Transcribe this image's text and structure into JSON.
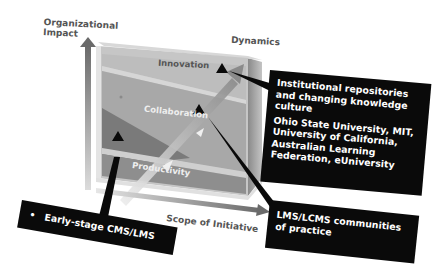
{
  "axes": {
    "y_label_line1": "Organizational",
    "y_label_line2": "Impact",
    "x_label": "Scope of Initiative",
    "dynamics_label": "Dynamics"
  },
  "layers": [
    {
      "name": "Innovation",
      "color": "#b9b9b9"
    },
    {
      "name": "Collaboration",
      "color": "#a2a2a2"
    },
    {
      "name": "Productivity",
      "color": "#888888"
    }
  ],
  "callouts": {
    "innovation": {
      "line1": "Institutional repositories",
      "line2": "and changing knowledge",
      "line3": "culture",
      "line4": "Ohio State University, MIT,",
      "line5": "University of California,",
      "line6": "Australian Learning",
      "line7": "Federation, eUniversity"
    },
    "collaboration": {
      "line1": "LMS/LCMS communities",
      "line2": "of practice"
    },
    "productivity": {
      "bullet": "•",
      "text": "Early-stage CMS/LMS"
    }
  },
  "colors": {
    "box_bg": "#0a0a0a",
    "axis_label": "#555555",
    "background": "#ffffff"
  }
}
